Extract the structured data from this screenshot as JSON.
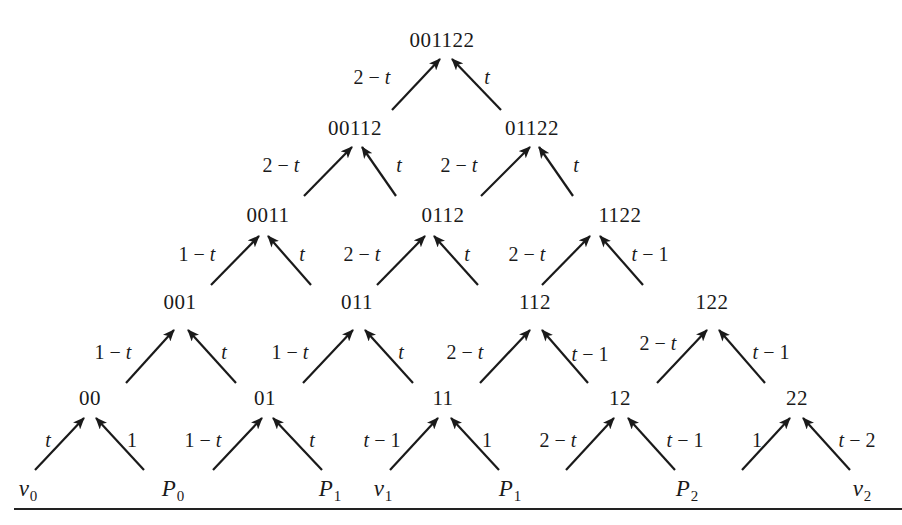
{
  "figure": {
    "type": "pyramid-recurrence-diagram",
    "colors": {
      "ink": "#1a1a1a",
      "background": "#ffffff"
    }
  },
  "nodes": [
    {
      "id": "001122",
      "label": "001122",
      "x": 442,
      "y": 40
    },
    {
      "id": "00112",
      "label": "00112",
      "x": 355,
      "y": 128
    },
    {
      "id": "01122",
      "label": "01122",
      "x": 532,
      "y": 128
    },
    {
      "id": "0011",
      "label": "0011",
      "x": 268,
      "y": 215
    },
    {
      "id": "0112",
      "label": "0112",
      "x": 443,
      "y": 215
    },
    {
      "id": "1122",
      "label": "1122",
      "x": 620,
      "y": 215
    },
    {
      "id": "001",
      "label": "001",
      "x": 180,
      "y": 302
    },
    {
      "id": "011",
      "label": "011",
      "x": 357,
      "y": 302
    },
    {
      "id": "112",
      "label": "112",
      "x": 535,
      "y": 302
    },
    {
      "id": "122",
      "label": "122",
      "x": 712,
      "y": 302
    },
    {
      "id": "00",
      "label": "00",
      "x": 90,
      "y": 398
    },
    {
      "id": "01",
      "label": "01",
      "x": 265,
      "y": 398
    },
    {
      "id": "11",
      "label": "11",
      "x": 443,
      "y": 398
    },
    {
      "id": "12",
      "label": "12",
      "x": 620,
      "y": 398
    },
    {
      "id": "22",
      "label": "22",
      "x": 797,
      "y": 398
    }
  ],
  "leaves": [
    {
      "id": "v0",
      "base": "v",
      "sub": "0",
      "x": 28,
      "y": 490
    },
    {
      "id": "P0",
      "base": "P",
      "sub": "0",
      "x": 173,
      "y": 490
    },
    {
      "id": "P1a",
      "base": "P",
      "sub": "1",
      "x": 330,
      "y": 490
    },
    {
      "id": "v1",
      "base": "v",
      "sub": "1",
      "x": 383,
      "y": 490
    },
    {
      "id": "P1b",
      "base": "P",
      "sub": "1",
      "x": 510,
      "y": 490
    },
    {
      "id": "P2",
      "base": "P",
      "sub": "2",
      "x": 687,
      "y": 490
    },
    {
      "id": "v2",
      "base": "v",
      "sub": "2",
      "x": 862,
      "y": 490
    }
  ],
  "edges": [
    {
      "from": "00112",
      "to": "001122",
      "label": "2 − t",
      "x1": 392,
      "y1": 110,
      "x2": 440,
      "y2": 59,
      "lx": 372,
      "ly": 77
    },
    {
      "from": "01122",
      "to": "001122",
      "label": "t",
      "x1": 501,
      "y1": 110,
      "x2": 452,
      "y2": 59,
      "lx": 487,
      "ly": 77
    },
    {
      "from": "0011",
      "to": "00112",
      "label": "2 − t",
      "x1": 304,
      "y1": 196,
      "x2": 352,
      "y2": 147,
      "lx": 281,
      "ly": 165
    },
    {
      "from": "0112",
      "to": "00112",
      "label": "t",
      "x1": 396,
      "y1": 196,
      "x2": 362,
      "y2": 147,
      "lx": 399,
      "ly": 165
    },
    {
      "from": "0112",
      "to": "01122",
      "label": "2 − t",
      "x1": 481,
      "y1": 196,
      "x2": 530,
      "y2": 147,
      "lx": 459,
      "ly": 165
    },
    {
      "from": "1122",
      "to": "01122",
      "label": "t",
      "x1": 573,
      "y1": 196,
      "x2": 539,
      "y2": 147,
      "lx": 576,
      "ly": 165
    },
    {
      "from": "001",
      "to": "0011",
      "label": "1 − t",
      "x1": 211,
      "y1": 285,
      "x2": 259,
      "y2": 236,
      "lx": 197,
      "ly": 254
    },
    {
      "from": "011",
      "to": "0011",
      "label": "t",
      "x1": 311,
      "y1": 285,
      "x2": 268,
      "y2": 236,
      "lx": 302,
      "ly": 254
    },
    {
      "from": "011",
      "to": "0112",
      "label": "2 − t",
      "x1": 377,
      "y1": 285,
      "x2": 425,
      "y2": 236,
      "lx": 362,
      "ly": 254
    },
    {
      "from": "112",
      "to": "0112",
      "label": "t",
      "x1": 478,
      "y1": 285,
      "x2": 434,
      "y2": 236,
      "lx": 467,
      "ly": 254
    },
    {
      "from": "112",
      "to": "1122",
      "label": "2 − t",
      "x1": 542,
      "y1": 285,
      "x2": 590,
      "y2": 236,
      "lx": 527,
      "ly": 254
    },
    {
      "from": "122",
      "to": "1122",
      "label": "t − 1",
      "x1": 643,
      "y1": 285,
      "x2": 600,
      "y2": 236,
      "lx": 650,
      "ly": 254
    },
    {
      "from": "00",
      "to": "001",
      "label": "1 − t",
      "x1": 126,
      "y1": 383,
      "x2": 174,
      "y2": 330,
      "lx": 113,
      "ly": 352
    },
    {
      "from": "01",
      "to": "001",
      "label": "t",
      "x1": 236,
      "y1": 383,
      "x2": 188,
      "y2": 330,
      "lx": 224,
      "ly": 352
    },
    {
      "from": "01",
      "to": "011",
      "label": "1 − t",
      "x1": 303,
      "y1": 383,
      "x2": 353,
      "y2": 330,
      "lx": 290,
      "ly": 352
    },
    {
      "from": "11",
      "to": "011",
      "label": "t",
      "x1": 413,
      "y1": 383,
      "x2": 365,
      "y2": 330,
      "lx": 401,
      "ly": 352
    },
    {
      "from": "11",
      "to": "112",
      "label": "2 − t",
      "x1": 480,
      "y1": 383,
      "x2": 530,
      "y2": 330,
      "lx": 465,
      "ly": 352
    },
    {
      "from": "12",
      "to": "112",
      "label": "t − 1",
      "x1": 588,
      "y1": 383,
      "x2": 542,
      "y2": 330,
      "lx": 590,
      "ly": 354
    },
    {
      "from": "12",
      "to": "122",
      "label": "2 − t",
      "x1": 657,
      "y1": 383,
      "x2": 707,
      "y2": 330,
      "lx": 658,
      "ly": 343
    },
    {
      "from": "22",
      "to": "122",
      "label": "t − 1",
      "x1": 765,
      "y1": 383,
      "x2": 719,
      "y2": 330,
      "lx": 771,
      "ly": 352
    },
    {
      "from": "v0",
      "to": "00",
      "label": "t",
      "x1": 35,
      "y1": 470,
      "x2": 84,
      "y2": 418,
      "lx": 48,
      "ly": 440
    },
    {
      "from": "P0",
      "to": "00",
      "label": "1",
      "x1": 144,
      "y1": 470,
      "x2": 96,
      "y2": 418,
      "lx": 132,
      "ly": 440
    },
    {
      "from": "P0",
      "to": "01",
      "label": "1 − t",
      "x1": 213,
      "y1": 470,
      "x2": 262,
      "y2": 418,
      "lx": 203,
      "ly": 440
    },
    {
      "from": "P1a",
      "to": "01",
      "label": "t",
      "x1": 322,
      "y1": 470,
      "x2": 273,
      "y2": 418,
      "lx": 312,
      "ly": 440
    },
    {
      "from": "v1",
      "to": "11",
      "label": "t − 1",
      "x1": 390,
      "y1": 470,
      "x2": 438,
      "y2": 418,
      "lx": 382,
      "ly": 440
    },
    {
      "from": "P1b",
      "to": "11",
      "label": "1",
      "x1": 499,
      "y1": 470,
      "x2": 451,
      "y2": 418,
      "lx": 487,
      "ly": 440
    },
    {
      "from": "P1b",
      "to": "12",
      "label": "2 − t",
      "x1": 566,
      "y1": 470,
      "x2": 614,
      "y2": 418,
      "lx": 558,
      "ly": 440
    },
    {
      "from": "P2",
      "to": "12",
      "label": "t − 1",
      "x1": 675,
      "y1": 470,
      "x2": 628,
      "y2": 418,
      "lx": 685,
      "ly": 440
    },
    {
      "from": "P2",
      "to": "22",
      "label": "1",
      "x1": 742,
      "y1": 470,
      "x2": 790,
      "y2": 418,
      "lx": 757,
      "ly": 440
    },
    {
      "from": "v2",
      "to": "22",
      "label": "t − 2",
      "x1": 850,
      "y1": 470,
      "x2": 803,
      "y2": 418,
      "lx": 857,
      "ly": 440
    }
  ]
}
